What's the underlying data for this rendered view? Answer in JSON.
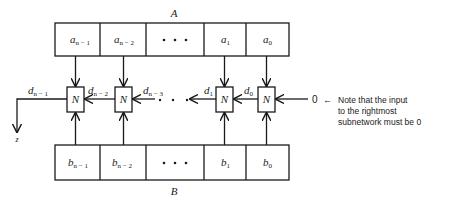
{
  "diagram": {
    "register_a": {
      "label": "A",
      "cells": [
        {
          "text": "a",
          "sub": "n − 1"
        },
        {
          "text": "a",
          "sub": "n − 2"
        },
        {
          "text": "• • •",
          "sub": ""
        },
        {
          "text": "a",
          "sub": "1"
        },
        {
          "text": "a",
          "sub": "0"
        }
      ]
    },
    "register_b": {
      "label": "B",
      "cells": [
        {
          "text": "b",
          "sub": "n − 1"
        },
        {
          "text": "b",
          "sub": "n − 2"
        },
        {
          "text": "• • •",
          "sub": ""
        },
        {
          "text": "b",
          "sub": "1"
        },
        {
          "text": "b",
          "sub": "0"
        }
      ]
    },
    "nodes": [
      {
        "label": "N"
      },
      {
        "label": "N"
      },
      {
        "label": "N"
      },
      {
        "label": "N"
      }
    ],
    "carries": [
      {
        "text": "d",
        "sub": "n − 1"
      },
      {
        "text": "d",
        "sub": "n − 2"
      },
      {
        "text": "d",
        "sub": "n − 3"
      },
      {
        "text": "d",
        "sub": "1"
      },
      {
        "text": "d",
        "sub": "0"
      }
    ],
    "output_label": "z",
    "input_value": "0",
    "note_arrow": "←",
    "note_lines": [
      "Note that the input",
      "to the rightmost",
      "subnetwork must be 0"
    ]
  }
}
